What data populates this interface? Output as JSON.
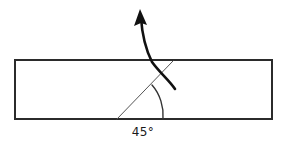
{
  "figure": {
    "title": "Ray entering a rectangular slab at 45 degrees",
    "background_color": "#ffffff",
    "canvas": {
      "width": 285,
      "height": 142
    }
  },
  "slab": {
    "name": "rectangular-slab",
    "x": 15,
    "y": 60,
    "width": 257,
    "height": 59,
    "stroke_color": "#2b2b2b",
    "stroke_width": 2,
    "fill_color": "#ffffff"
  },
  "incident_ray": {
    "name": "incident-ray",
    "from_x": 117,
    "from_y": 119,
    "to_x": 173,
    "to_y": 61,
    "stroke_color": "#555555",
    "stroke_width": 1
  },
  "deflected_arrow": {
    "name": "deflected-arrow",
    "path": "M 175,89 C 169,80 160,73 152,62 C 146,50 142,33 141,18",
    "stroke_color": "#111111",
    "stroke_width": 2.6,
    "arrowhead": {
      "tip_x": 140,
      "tip_y": 9,
      "color": "#111111"
    }
  },
  "angle_arc": {
    "name": "angle-arc",
    "path": "M 152,85 C 160,94 164,107 163,119",
    "stroke_color": "#333333",
    "stroke_width": 1.4
  },
  "angle_label": {
    "name": "angle-label",
    "text": "45°",
    "x": 143,
    "y": 136,
    "color": "#1a1a1a",
    "font_size": 12
  }
}
